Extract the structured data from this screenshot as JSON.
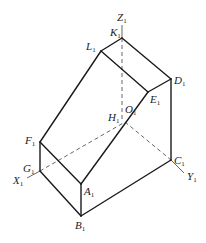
{
  "diagram": {
    "points": {
      "K1": {
        "label": "K",
        "sub": "1"
      },
      "L1": {
        "label": "L",
        "sub": "1"
      },
      "D1": {
        "label": "D",
        "sub": "1"
      },
      "E1": {
        "label": "E",
        "sub": "1"
      },
      "O1": {
        "label": "O",
        "sub": "1"
      },
      "H1": {
        "label": "H",
        "sub": "1"
      },
      "F1": {
        "label": "F",
        "sub": "1"
      },
      "G1": {
        "label": "G",
        "sub": "1"
      },
      "A1": {
        "label": "A",
        "sub": "1"
      },
      "B1": {
        "label": "B",
        "sub": "1"
      },
      "C1": {
        "label": "C",
        "sub": "1"
      }
    },
    "axes": {
      "X1": {
        "label": "X",
        "sub": "1"
      },
      "Y1": {
        "label": "Y",
        "sub": "1"
      },
      "Z1": {
        "label": "Z",
        "sub": "1"
      }
    },
    "colors": {
      "edge": "#1a1a1a",
      "hidden": "#555555",
      "background": "#ffffff"
    }
  }
}
